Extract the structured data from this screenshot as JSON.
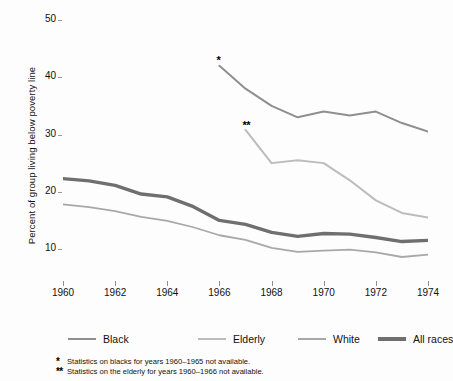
{
  "chart_data": {
    "type": "line",
    "title": "",
    "xlabel": "",
    "ylabel": "Percent of group living below poverty line",
    "xlim": [
      1960,
      1974
    ],
    "ylim": [
      5,
      52
    ],
    "xticks": [
      1960,
      1962,
      1964,
      1966,
      1968,
      1970,
      1972,
      1974
    ],
    "yticks": [
      10,
      20,
      30,
      40,
      50
    ],
    "grid": false,
    "legend_position": "below",
    "series": [
      {
        "name": "Black",
        "color": "#8f8f8f",
        "width": 2.0,
        "note_marker": "*",
        "x": [
          1966,
          1967,
          1968,
          1969,
          1970,
          1971,
          1972,
          1973,
          1974
        ],
        "values": [
          42.0,
          38.0,
          35.0,
          33.0,
          34.0,
          33.3,
          34.0,
          32.0,
          30.5
        ]
      },
      {
        "name": "Elderly",
        "color": "#bcbcbc",
        "width": 2.0,
        "note_marker": "**",
        "x": [
          1967,
          1968,
          1969,
          1970,
          1971,
          1972,
          1973,
          1974
        ],
        "values": [
          30.8,
          25.0,
          25.5,
          25.0,
          22.0,
          18.5,
          16.3,
          15.5
        ]
      },
      {
        "name": "White",
        "color": "#a8a8a8",
        "width": 1.8,
        "note_marker": "",
        "x": [
          1960,
          1961,
          1962,
          1963,
          1964,
          1965,
          1966,
          1967,
          1968,
          1969,
          1970,
          1971,
          1972,
          1973,
          1974
        ],
        "values": [
          17.8,
          17.3,
          16.6,
          15.6,
          14.9,
          13.8,
          12.4,
          11.6,
          10.2,
          9.5,
          9.7,
          9.9,
          9.4,
          8.6,
          9.0
        ]
      },
      {
        "name": "All races",
        "color": "#6f6f6f",
        "width": 3.4,
        "note_marker": "",
        "x": [
          1960,
          1961,
          1962,
          1963,
          1964,
          1965,
          1966,
          1967,
          1968,
          1969,
          1970,
          1971,
          1972,
          1973,
          1974
        ],
        "values": [
          22.3,
          21.9,
          21.1,
          19.6,
          19.1,
          17.4,
          15.0,
          14.3,
          12.9,
          12.2,
          12.7,
          12.6,
          12.0,
          11.3,
          11.5
        ]
      }
    ],
    "annotations": [
      {
        "id": "star-black",
        "text": "*",
        "x": 1966,
        "y": 43.6
      },
      {
        "id": "star-elderly",
        "text": "**",
        "x": 1967,
        "y": 32.2
      }
    ],
    "footnotes": [
      {
        "marker": "*",
        "text": "Statistics on blacks for years 1960–1965 not available."
      },
      {
        "marker": "**",
        "text": "Statistics on the elderly for years 1960–1966 not available."
      }
    ]
  }
}
